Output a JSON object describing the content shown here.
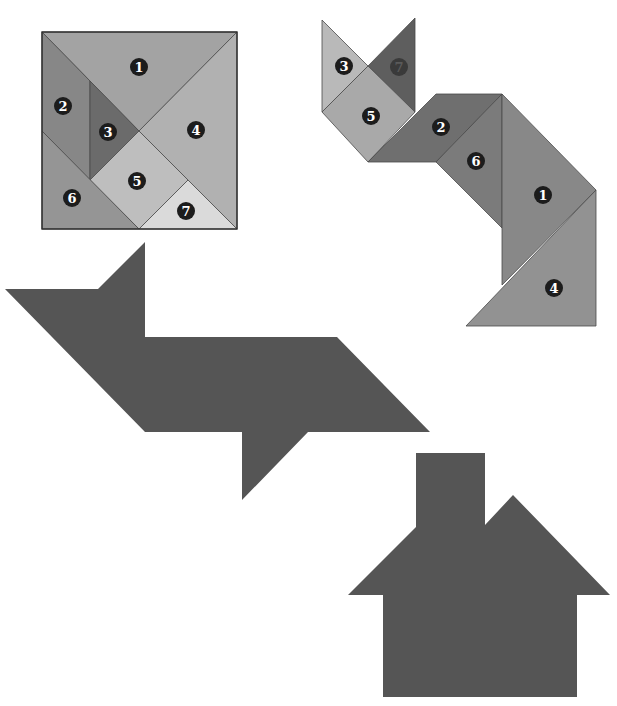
{
  "colors": {
    "background": "#ffffff",
    "silhouette": "#555555",
    "outline": "#4a4a4a",
    "badge": "#1c1c1c"
  },
  "square_puzzle": {
    "label": "tangram-square",
    "pieces": [
      {
        "id": "1",
        "shape": "large-triangle",
        "color": "#a3a3a3",
        "points": "42,32 237,32 139,131",
        "label_pos": [
          139,
          67
        ]
      },
      {
        "id": "2",
        "shape": "parallelogram",
        "color": "#878787",
        "points": "42,32 90,81 90,180 42,131",
        "label_pos": [
          63,
          106
        ]
      },
      {
        "id": "3",
        "shape": "small-triangle",
        "color": "#6b6b6b",
        "points": "90,81 139,131 90,180",
        "label_pos": [
          108,
          132
        ]
      },
      {
        "id": "4",
        "shape": "large-triangle",
        "color": "#b1b1b1",
        "points": "237,32 139,131 237,229",
        "label_pos": [
          196,
          130
        ]
      },
      {
        "id": "5",
        "shape": "square",
        "color": "#bebebe",
        "points": "139,131 188,180 139,229 90,180",
        "label_pos": [
          137,
          181
        ]
      },
      {
        "id": "6",
        "shape": "medium-triangle",
        "color": "#959595",
        "points": "42,131 139,229 42,229",
        "label_pos": [
          72,
          198
        ]
      },
      {
        "id": "7",
        "shape": "small-triangle",
        "color": "#dadada",
        "points": "188,180 237,229 139,229",
        "label_pos": [
          186,
          211
        ]
      }
    ],
    "frame": {
      "x": 42,
      "y": 32,
      "width": 195,
      "height": 197
    }
  },
  "cat_puzzle": {
    "label": "tangram-cat",
    "pieces": [
      {
        "id": "3",
        "shape": "small-triangle",
        "color": "#b9b9b9",
        "points": "322,20 368,66 322,112",
        "label_pos": [
          344,
          66
        ],
        "faint": false
      },
      {
        "id": "7",
        "shape": "small-triangle",
        "color": "#5e5e5e",
        "points": "415,18 415,112 368,66",
        "label_pos": [
          399,
          67
        ],
        "faint": true
      },
      {
        "id": "5",
        "shape": "square",
        "color": "#a9a9a9",
        "points": "368,66 415,112 368,162 322,112",
        "label_pos": [
          371,
          116
        ],
        "faint": false
      },
      {
        "id": "2",
        "shape": "parallelogram",
        "color": "#6f6f6f",
        "points": "368,162 436,94 502,94 436,162",
        "label_pos": [
          441,
          127
        ],
        "faint": false
      },
      {
        "id": "6",
        "shape": "medium-triangle",
        "color": "#7b7b7b",
        "points": "502,94 502,228 436,162",
        "label_pos": [
          476,
          161
        ],
        "faint": false
      },
      {
        "id": "1",
        "shape": "large-triangle",
        "color": "#888888",
        "points": "502,94 596,190 502,285",
        "label_pos": [
          543,
          195
        ],
        "faint": false
      },
      {
        "id": "4",
        "shape": "large-triangle",
        "color": "#929292",
        "points": "596,190 596,326 466,326",
        "label_pos": [
          554,
          288
        ],
        "faint": false
      }
    ]
  },
  "silhouettes": [
    {
      "name": "bird",
      "color": "#555555",
      "points": "5,289 98,289 145,242 145,337 337,337 430,432 308,432 242,500 242,432 145,432"
    },
    {
      "name": "house",
      "color": "#555555",
      "points": "348,595 416,527 416,453 485,453 485,525 513,495 610,595 577,595 577,697 383,697 383,595"
    }
  ]
}
